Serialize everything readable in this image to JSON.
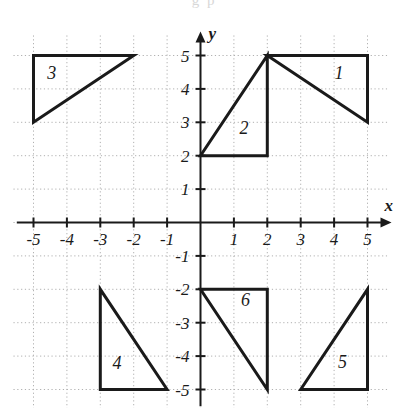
{
  "figure": {
    "name": "coordinate-plane-with-six-triangles",
    "background_color": "#ffffff",
    "ink_color": "#1a1a1a",
    "grid_color": "#b0b0b0",
    "partial_text_top": "g p"
  },
  "axes": {
    "x_label": "x",
    "y_label": "y",
    "x_min": -5.6,
    "x_max": 5.6,
    "y_min": -5.6,
    "y_max": 5.6,
    "x_tick_labels": [
      "-5",
      "-4",
      "-3",
      "-2",
      "-1",
      "1",
      "2",
      "3",
      "4",
      "5"
    ],
    "x_tick_values": [
      -5,
      -4,
      -3,
      -2,
      -1,
      1,
      2,
      3,
      4,
      5
    ],
    "y_tick_labels": [
      "5",
      "4",
      "3",
      "2",
      "1",
      "-1",
      "-2",
      "-3",
      "-4",
      "-5"
    ],
    "y_tick_values": [
      5,
      4,
      3,
      2,
      1,
      -1,
      -2,
      -3,
      -4,
      -5
    ],
    "grid": true,
    "grid_style": "dotted",
    "arrowheads": [
      "x-positive",
      "y-positive"
    ]
  },
  "chart_data": {
    "type": "scatter",
    "title": "",
    "xlabel": "x",
    "ylabel": "y",
    "xlim": [
      -5.6,
      5.6
    ],
    "ylim": [
      -5.6,
      5.6
    ],
    "grid": true,
    "legend": "none",
    "shapes": [
      {
        "name": "triangle-1",
        "label": "1",
        "label_point": [
          4.15,
          4.3
        ],
        "vertices": [
          [
            2,
            5
          ],
          [
            5,
            5
          ],
          [
            5,
            3
          ]
        ]
      },
      {
        "name": "triangle-2",
        "label": "2",
        "label_point": [
          1.3,
          2.65
        ],
        "vertices": [
          [
            0,
            2
          ],
          [
            2,
            2
          ],
          [
            2,
            5
          ]
        ]
      },
      {
        "name": "triangle-3",
        "label": "3",
        "label_point": [
          -4.45,
          4.3
        ],
        "vertices": [
          [
            -5,
            5
          ],
          [
            -2,
            5
          ],
          [
            -5,
            3
          ]
        ]
      },
      {
        "name": "triangle-4",
        "label": "4",
        "label_point": [
          -2.5,
          -4.4
        ],
        "vertices": [
          [
            -3,
            -2
          ],
          [
            -3,
            -5
          ],
          [
            -1,
            -5
          ]
        ]
      },
      {
        "name": "triangle-5",
        "label": "5",
        "label_point": [
          4.25,
          -4.35
        ],
        "vertices": [
          [
            3,
            -5
          ],
          [
            5,
            -5
          ],
          [
            5,
            -2
          ]
        ]
      },
      {
        "name": "triangle-6",
        "label": "6",
        "label_point": [
          1.35,
          -2.5
        ],
        "vertices": [
          [
            0,
            -2
          ],
          [
            2,
            -2
          ],
          [
            2,
            -5
          ]
        ]
      }
    ]
  }
}
